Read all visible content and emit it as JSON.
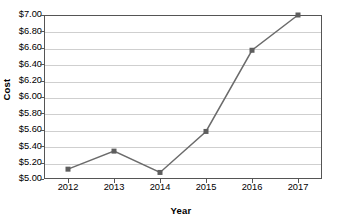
{
  "chart_data": {
    "type": "line",
    "title": "",
    "xlabel": "Year",
    "ylabel": "Cost",
    "categories": [
      "2012",
      "2013",
      "2014",
      "2015",
      "2016",
      "2017"
    ],
    "x": [
      2012,
      2013,
      2014,
      2015,
      2016,
      2017
    ],
    "series": [
      {
        "name": "Cost",
        "values": [
          5.12,
          5.34,
          5.08,
          5.58,
          6.57,
          7.0
        ]
      }
    ],
    "ylim": [
      5.0,
      7.0
    ],
    "ytick_step": 0.2,
    "ytick_labels": [
      "$7.00",
      "$6.80",
      "$6.60",
      "$6.40",
      "$6.20",
      "$6.00",
      "$5.80",
      "$5.60",
      "$5.40",
      "$5.20",
      "$5.00"
    ],
    "ytick_values": [
      7.0,
      6.8,
      6.6,
      6.4,
      6.2,
      6.0,
      5.8,
      5.6,
      5.4,
      5.2,
      5.0
    ],
    "xtick_labels": [
      "2012",
      "2013",
      "2014",
      "2015",
      "2016",
      "2017"
    ],
    "grid": "horizontal",
    "legend": "none",
    "line_color": "#6b6b6b",
    "marker": "square",
    "marker_color": "#5e5e5e",
    "gridline_color": "#cfcfcf",
    "frame_color": "#555555",
    "background": "#ffffff"
  }
}
